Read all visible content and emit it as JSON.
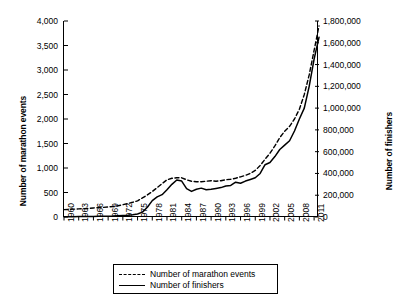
{
  "chart_data": {
    "type": "line",
    "title": "",
    "xlabel": "",
    "ylabel": "Number of marathon events",
    "ylabel_right": "Number of finishers",
    "grid": false,
    "legend_position": "bottom-center",
    "xlim": [
      1960,
      2012
    ],
    "ylim": [
      0,
      4000
    ],
    "ylim_right": [
      0,
      1800000
    ],
    "xticks": [
      1960,
      1963,
      1966,
      1969,
      1972,
      1975,
      1978,
      1981,
      1984,
      1987,
      1990,
      1993,
      1996,
      1999,
      2002,
      2005,
      2008,
      2011
    ],
    "yticks_left": [
      "0",
      "500",
      "1,000",
      "1,500",
      "2,000",
      "2,500",
      "3,000",
      "3,500",
      "4,000"
    ],
    "yticks_right": [
      "0",
      "200,000",
      "400,000",
      "600,000",
      "800,000",
      "1,000,000",
      "1,200,000",
      "1,400,000",
      "1,600,000",
      "1,800,000"
    ],
    "x": [
      1960,
      1961,
      1962,
      1963,
      1964,
      1965,
      1966,
      1967,
      1968,
      1969,
      1970,
      1971,
      1972,
      1973,
      1974,
      1975,
      1976,
      1977,
      1978,
      1979,
      1980,
      1981,
      1982,
      1983,
      1984,
      1985,
      1986,
      1987,
      1988,
      1989,
      1990,
      1991,
      1992,
      1993,
      1994,
      1995,
      1996,
      1997,
      1998,
      1999,
      2000,
      2001,
      2002,
      2003,
      2004,
      2005,
      2006,
      2007,
      2008,
      2009,
      2010,
      2011,
      2012
    ],
    "series": [
      {
        "name": "Number of marathon events",
        "axis": "left",
        "style": "dashed",
        "color": "#000000",
        "values": [
          150,
          155,
          160,
          165,
          170,
          175,
          185,
          190,
          195,
          205,
          215,
          230,
          250,
          275,
          300,
          330,
          390,
          450,
          520,
          600,
          680,
          760,
          790,
          800,
          800,
          760,
          730,
          720,
          720,
          730,
          740,
          730,
          740,
          760,
          770,
          790,
          820,
          850,
          890,
          950,
          1050,
          1180,
          1300,
          1450,
          1620,
          1750,
          1850,
          2000,
          2200,
          2500,
          2900,
          3400,
          3900
        ]
      },
      {
        "name": "Number of finishers",
        "axis": "right",
        "style": "solid",
        "color": "#000000",
        "values": [
          2000,
          2500,
          3000,
          3500,
          4000,
          4500,
          5000,
          6000,
          7000,
          8000,
          9000,
          11000,
          13000,
          16000,
          20000,
          28000,
          45000,
          90000,
          150000,
          185000,
          205000,
          250000,
          300000,
          340000,
          330000,
          260000,
          235000,
          255000,
          265000,
          250000,
          255000,
          262000,
          270000,
          285000,
          290000,
          320000,
          310000,
          330000,
          345000,
          360000,
          400000,
          480000,
          500000,
          555000,
          620000,
          660000,
          700000,
          790000,
          900000,
          1000000,
          1200000,
          1450000,
          1650000
        ]
      }
    ]
  },
  "legend": {
    "items": [
      {
        "label": "Number of marathon events",
        "style": "dashed"
      },
      {
        "label": "Number of finishers",
        "style": "solid"
      }
    ]
  }
}
